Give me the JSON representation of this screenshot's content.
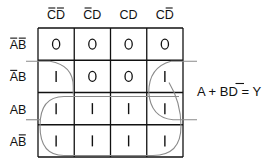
{
  "diagram": {
    "type": "karnaugh-map",
    "column_headers": [
      {
        "text": "CD",
        "overbar": "both"
      },
      {
        "text": "CD",
        "overbar": "first"
      },
      {
        "text": "CD",
        "overbar": "none"
      },
      {
        "text": "CD",
        "overbar": "second"
      }
    ],
    "column_labels": [
      "C̄D̄",
      "C̄D",
      "CD",
      "CD̄"
    ],
    "row_headers": [
      {
        "text": "AB",
        "overbar": "both"
      },
      {
        "text": "AB",
        "overbar": "first"
      },
      {
        "text": "AB",
        "overbar": "none"
      },
      {
        "text": "AB",
        "overbar": "second"
      }
    ],
    "row_labels": [
      "ĀB̄",
      "ĀB",
      "AB",
      "AB̄"
    ],
    "cells": [
      [
        "0",
        "0",
        "0",
        "0"
      ],
      [
        "1",
        "0",
        "0",
        "1"
      ],
      [
        "1",
        "1",
        "1",
        "1"
      ],
      [
        "1",
        "1",
        "1",
        "1"
      ]
    ],
    "groupings": [
      {
        "term": "A",
        "rows": [
          2,
          3
        ],
        "cols": [
          0,
          1,
          2,
          3
        ]
      },
      {
        "term": "BD̄",
        "rows": [
          1,
          2
        ],
        "cols": [
          0,
          3
        ],
        "wraps": "horizontal"
      }
    ],
    "equation": {
      "lhs_parts": [
        "A + B",
        "D",
        " = Y"
      ],
      "overbar_part_index": 1,
      "full_text": "A + BD̄ = Y"
    },
    "colors": {
      "grid": "#111111",
      "loop": "#8a8a8a",
      "text": "#111111"
    }
  }
}
